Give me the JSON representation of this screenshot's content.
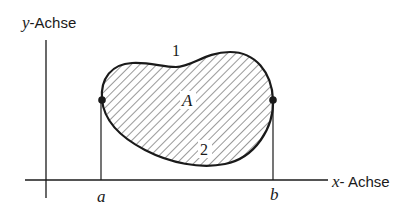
{
  "diagram": {
    "axes": {
      "y_label_var": "y",
      "y_label_text": "-Achse",
      "x_label_var": "x",
      "x_label_text": "- Achse"
    },
    "region_label": "A",
    "curve_labels": {
      "upper": "1",
      "lower": "2"
    },
    "bounds": {
      "left": "a",
      "right": "b"
    },
    "colors": {
      "ink": "#1a1a1a",
      "background": "#ffffff"
    }
  }
}
